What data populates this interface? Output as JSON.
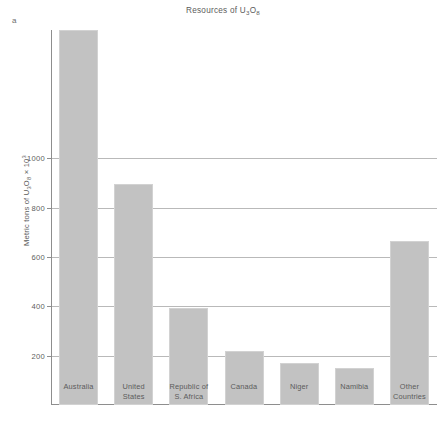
{
  "figure": {
    "letter": "a",
    "title_text": "Resources of U",
    "title_sub1": "3",
    "title_mid": "O",
    "title_sub2": "8",
    "ylabel_pre": "Metric tons of U",
    "ylabel_sub1": "3",
    "ylabel_mid": "O",
    "ylabel_sub2": "8",
    "ylabel_post": " × 10",
    "ylabel_sup": "3"
  },
  "colors": {
    "bar_fill": "#c2c2c2",
    "bar_edge": "#d2d2d2",
    "gridline": "#b9b9b9",
    "axis": "#8e8e8e",
    "text": "#5b5b5b",
    "background": "#ffffff"
  },
  "chart_data": {
    "type": "bar",
    "title": "Resources of U3O8",
    "xlabel": "",
    "ylabel": "Metric tons of U3O8 × 10^3",
    "categories": [
      "Australia",
      "United States",
      "Republic of S. Africa",
      "Canada",
      "Niger",
      "Namibia",
      "Other Countries"
    ],
    "category_lines": [
      [
        "Australia"
      ],
      [
        "United",
        "States"
      ],
      [
        "Republic of",
        "S. Africa"
      ],
      [
        "Canada"
      ],
      [
        "Niger"
      ],
      [
        "Namibia"
      ],
      [
        "Other",
        "Countries"
      ]
    ],
    "values": [
      1520,
      895,
      395,
      218,
      170,
      148,
      665
    ],
    "ylim": [
      0,
      1520
    ],
    "yticks": [
      200,
      400,
      600,
      800,
      1000
    ],
    "ytick_labels": [
      "200",
      "400",
      "600",
      "800",
      "1000"
    ],
    "grid": true,
    "legend": null
  }
}
